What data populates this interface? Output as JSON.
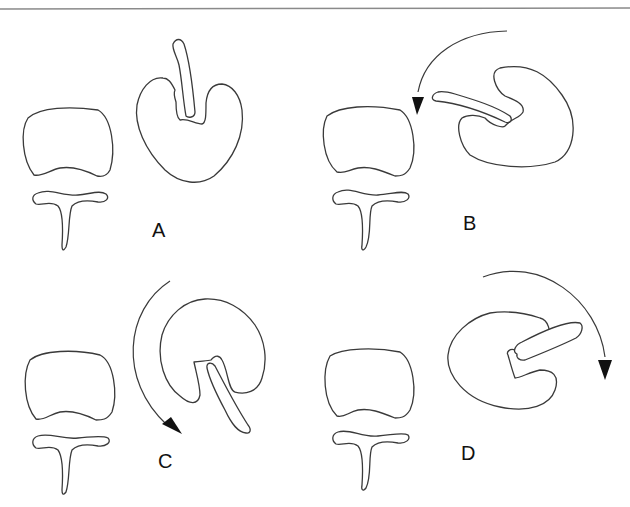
{
  "figure": {
    "panels": [
      {
        "id": "A",
        "label": "A",
        "rotation_arrow": "none"
      },
      {
        "id": "B",
        "label": "B",
        "rotation_arrow": "counterclockwise-left"
      },
      {
        "id": "C",
        "label": "C",
        "rotation_arrow": "downward-left-arc"
      },
      {
        "id": "D",
        "label": "D",
        "rotation_arrow": "clockwise-right"
      }
    ],
    "stroke_color": "#3a3a3a",
    "background_color": "#ffffff"
  }
}
